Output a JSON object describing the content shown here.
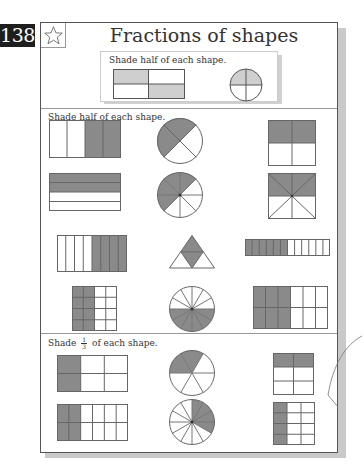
{
  "page_number": "138",
  "title": "Fractions of shapes",
  "colors": {
    "shade": "#8a8a8a",
    "light_shade": "#cfcfcf",
    "line": "#666666",
    "badge_bg": "#1e1e1e"
  },
  "example": {
    "instruction": "Shade half of each shape.",
    "shapes": [
      {
        "type": "rect-grid",
        "cols": 2,
        "rows": 2,
        "shaded": [
          "r0c0",
          "r1c1"
        ]
      },
      {
        "type": "circle",
        "slices": 4,
        "shaded": [
          "top-left",
          "top-right"
        ]
      }
    ]
  },
  "section_half": {
    "instruction": "Shade half of each shape.",
    "shapes": [
      {
        "type": "rect-grid",
        "cols": 4,
        "rows": 1,
        "shaded_cols": [
          2,
          3
        ]
      },
      {
        "type": "circle",
        "slices": 4,
        "dividers": "diagonal",
        "shaded": [
          "top",
          "left"
        ]
      },
      {
        "type": "rect-grid",
        "cols": 2,
        "rows": 2,
        "shaded": "top row"
      },
      {
        "type": "rect-grid",
        "cols": 1,
        "rows": 4,
        "shaded_rows": [
          0,
          1
        ]
      },
      {
        "type": "circle",
        "slices": 8,
        "shaded_count": 4
      },
      {
        "type": "square-8-triangles",
        "shaded": "top half"
      },
      {
        "type": "rect-grid",
        "cols": 8,
        "rows": 1,
        "shaded_cols": [
          4,
          5,
          6,
          7
        ]
      },
      {
        "type": "triangle-4",
        "shaded": [
          "top",
          "center"
        ]
      },
      {
        "type": "rect-grid",
        "cols": 12,
        "rows": 1,
        "shaded_cols": [
          0,
          1,
          2,
          3,
          4,
          5
        ]
      },
      {
        "type": "rect-grid",
        "cols": 4,
        "rows": 4,
        "shaded_cols": [
          0,
          1
        ]
      },
      {
        "type": "circle",
        "slices": 12,
        "shaded": "bottom half"
      },
      {
        "type": "rect-grid",
        "cols": 6,
        "rows": 2,
        "shaded_cols": [
          0,
          1,
          2
        ]
      }
    ]
  },
  "section_third": {
    "instruction_prefix": "Shade",
    "fraction_numerator": "1",
    "fraction_denominator": "3",
    "instruction_suffix": "of each shape.",
    "shapes": [
      {
        "type": "rect-grid",
        "cols": 3,
        "rows": 2,
        "shaded_cols": [
          0
        ]
      },
      {
        "type": "circle",
        "slices": 6,
        "shaded_count": 2
      },
      {
        "type": "rect-grid",
        "cols": 2,
        "rows": 3,
        "shaded_rows": [
          0
        ]
      },
      {
        "type": "rect-grid",
        "cols": 6,
        "rows": 2,
        "shaded_cols": [
          0,
          1
        ]
      },
      {
        "type": "circle",
        "slices": 12,
        "shaded_count": 4
      },
      {
        "type": "rect-grid",
        "cols": 3,
        "rows": 4,
        "shaded_cols": [
          0
        ]
      }
    ]
  }
}
